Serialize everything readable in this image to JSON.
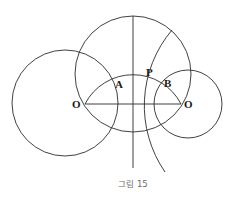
{
  "figure": {
    "caption": "그림 15",
    "labels": {
      "O_left": "O",
      "O_right": "O",
      "A": "A",
      "P": "P",
      "B": "B"
    },
    "stroke_color": "#2b2b2b",
    "caption_color": "#6b6b6b"
  },
  "geometry": {
    "left_circle": {
      "cx": 65,
      "cy": 103,
      "r": 53
    },
    "big_circle": {
      "cx": 133,
      "cy": 74,
      "r": 58
    },
    "right_circle": {
      "cx": 188,
      "cy": 104,
      "r": 34
    },
    "points": {
      "O_left": [
        85,
        104
      ],
      "O_right": [
        181,
        104
      ]
    }
  }
}
